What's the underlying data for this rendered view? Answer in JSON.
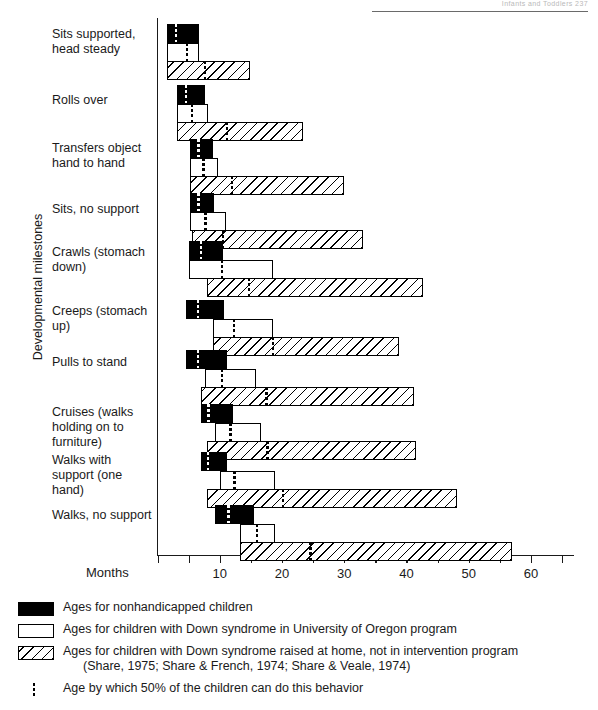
{
  "page": {
    "running_head": "Infants and Toddlers   237"
  },
  "chart_data": {
    "type": "bar",
    "title": "",
    "xlabel": "Months",
    "ylabel": "Developmental milestones",
    "xlim": [
      0,
      67
    ],
    "grid": false,
    "legend_position": "below",
    "xticks": [
      0,
      5,
      10,
      15,
      20,
      25,
      30,
      35,
      40,
      45,
      50,
      55,
      60,
      65
    ],
    "xticklabels": [
      "",
      "",
      "10",
      "",
      "20",
      "",
      "30",
      "",
      "40",
      "",
      "50",
      "",
      "60",
      ""
    ],
    "categories": [
      "Sits supported, head steady",
      "Rolls over",
      "Transfers object hand to hand",
      "Sits, no support",
      "Crawls (stomach down)",
      "Creeps (stomach up)",
      "Pulls to stand",
      "Cruises (walks holding on to furniture)",
      "Walks with support (one hand)",
      "Walks, no support"
    ],
    "series": [
      {
        "name": "Ages for nonhandicapped children",
        "style": "black",
        "ranges": [
          [
            1.5,
            6.6
          ],
          [
            3.2,
            7.7
          ],
          [
            5.3,
            8.9
          ],
          [
            5.3,
            9.0
          ],
          [
            5.1,
            10.6
          ],
          [
            4.5,
            10.7
          ],
          [
            4.5,
            11.1
          ],
          [
            7.0,
            12.1
          ],
          [
            7.0,
            11.1
          ],
          [
            9.2,
            15.5
          ]
        ],
        "medians": [
          3.0,
          4.6,
          6.6,
          6.6,
          7.0,
          6.5,
          6.5,
          8.2,
          8.1,
          11.4
        ]
      },
      {
        "name": "Ages for children with Down syndrome in University of Oregon program",
        "style": "white",
        "ranges": [
          [
            1.5,
            6.6
          ],
          [
            3.2,
            8.1
          ],
          [
            5.3,
            9.7
          ],
          [
            5.3,
            11.0
          ],
          [
            5.1,
            18.5
          ],
          [
            8.9,
            18.6
          ],
          [
            7.7,
            15.9
          ],
          [
            9.3,
            16.6
          ],
          [
            10.0,
            18.9
          ],
          [
            13.2,
            18.9
          ]
        ],
        "medians": [
          4.7,
          5.5,
          7.4,
          7.7,
          10.4,
          12.3,
          10.4,
          11.7,
          12.4,
          16.0
        ]
      },
      {
        "name": "Ages for children with Down syndrome raised at home, not in intervention program",
        "style": "hatch",
        "ranges": [
          [
            1.5,
            14.8
          ],
          [
            3.2,
            23.4
          ],
          [
            5.3,
            29.9
          ],
          [
            5.6,
            33.0
          ],
          [
            7.9,
            42.6
          ],
          [
            8.9,
            38.8
          ],
          [
            7.0,
            41.2
          ],
          [
            7.9,
            41.5
          ],
          [
            7.9,
            48.1
          ],
          [
            13.2,
            57.0
          ]
        ],
        "medians": [
          7.6,
          11.2,
          12.0,
          10.5,
          14.7,
          18.6,
          17.5,
          17.7,
          20.2,
          24.6
        ]
      }
    ],
    "median_note": "Age by which 50% of the children can do this behavior"
  },
  "legend": {
    "items": [
      {
        "swatch": "black",
        "label": "Ages for nonhandicapped children",
        "sub": ""
      },
      {
        "swatch": "white",
        "label": "Ages for children with Down syndrome in University of Oregon program",
        "sub": ""
      },
      {
        "swatch": "hatch",
        "label": "Ages for children with Down syndrome raised at home, not in intervention program",
        "sub": "(Share, 1975; Share & French, 1974; Share & Veale, 1974)"
      },
      {
        "swatch": "dotted",
        "label": "Age by which 50% of the children can do this behavior",
        "sub": ""
      }
    ]
  }
}
